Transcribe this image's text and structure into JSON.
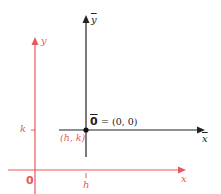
{
  "diagram": {
    "colors": {
      "original_axes": "#e8585a",
      "translated_axes": "#222222"
    },
    "original_axes": {
      "x_label": "x",
      "y_label": "y",
      "origin_label": "0",
      "h_tick_label": "h",
      "k_tick_label": "k",
      "point_label": "(h, k)"
    },
    "translated_axes": {
      "x_label": "x",
      "y_label": "y",
      "origin_symbol": "0",
      "origin_equation": "= (0, 0)"
    }
  }
}
